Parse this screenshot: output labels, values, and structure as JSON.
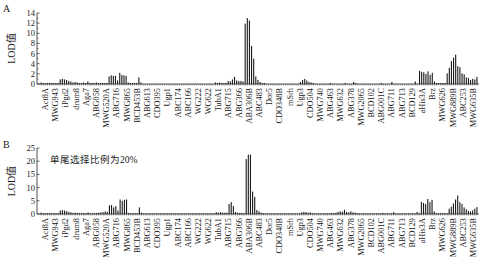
{
  "chart_data": [
    {
      "panel_label": "A",
      "type": "bar",
      "title": "",
      "annotation": "",
      "xlabel": "",
      "ylabel": "LOD值",
      "ylim": [
        0,
        14
      ],
      "yticks": [
        0,
        2,
        4,
        6,
        8,
        10,
        12,
        14
      ],
      "grid": false,
      "x_tick_labels": [
        "Act8A",
        "MWG943",
        "iPgd2",
        "drum8",
        "Aga7",
        "ABG058",
        "MWG520A",
        "ABG716",
        "MWG865",
        "BCD453B",
        "ABG613",
        "CDO395",
        "Ugp1",
        "ABC174",
        "ABC166",
        "WG222",
        "WG622",
        "TubA1",
        "ABG715",
        "ABG366",
        "ABA306B",
        "ABC483",
        "Dor5",
        "CDO348B",
        "mSrh",
        "Ugp3",
        "CDO504",
        "MWG740",
        "ABG463",
        "MWG632",
        "ABG378",
        "MWG2065",
        "BCD102",
        "ABG001C",
        "ABG711",
        "ABG713",
        "BCD129",
        "aHis3A",
        "Brz",
        "MWG626",
        "MWG889B",
        "ABC253",
        "MWG635B"
      ],
      "values": [
        0.3,
        0.2,
        0.2,
        0.2,
        0.2,
        0.2,
        0.2,
        0.2,
        0.2,
        0.9,
        1.0,
        0.9,
        0.8,
        0.6,
        0.5,
        0.3,
        0.4,
        0.3,
        0.2,
        0.2,
        0.3,
        0.2,
        0.5,
        0.2,
        0.2,
        0.2,
        0.3,
        0.2,
        0.2,
        0.2,
        0.2,
        0.2,
        1.5,
        1.7,
        1.6,
        1.6,
        0.7,
        2.2,
        1.8,
        1.7,
        1.6,
        0.3,
        0.2,
        0.2,
        0.2,
        0.2,
        1.3,
        0.3,
        0.1,
        0.1,
        0.1,
        0.1,
        0.1,
        0.1,
        0.1,
        0.1,
        0.1,
        0.1,
        0.1,
        0.1,
        0.1,
        0.1,
        0.1,
        0.1,
        0.1,
        0.1,
        0.1,
        0.1,
        0.1,
        0.1,
        0.1,
        0.1,
        0.1,
        0.1,
        0.1,
        0.1,
        0.1,
        0.1,
        0.1,
        0.1,
        0.1,
        0.1,
        0.3,
        0.2,
        0.3,
        0.2,
        0.2,
        0.2,
        0.6,
        0.5,
        0.9,
        1.4,
        0.7,
        0.6,
        0.6,
        0.5,
        11.9,
        13.0,
        12.5,
        7.5,
        5.0,
        1.5,
        0.8,
        0.4,
        0.2,
        0.2,
        0.1,
        0.1,
        0.1,
        0.1,
        0.1,
        0.1,
        0.1,
        0.1,
        0.1,
        0.1,
        0.1,
        0.1,
        0.1,
        0.1,
        0.1,
        0.1,
        0.4,
        0.8,
        1.0,
        0.7,
        0.4,
        0.3,
        0.2,
        0.1,
        0.1,
        0.1,
        0.1,
        0.1,
        0.1,
        0.1,
        0.2,
        0.1,
        0.1,
        0.1,
        0.1,
        0.1,
        0.1,
        0.2,
        0.1,
        0.1,
        0.1,
        0.4,
        0.2,
        0.1,
        0.1,
        0.1,
        0.1,
        0.1,
        0.1,
        0.1,
        0.1,
        0.1,
        0.1,
        0.1,
        0.2,
        0.1,
        0.1,
        0.1,
        0.1,
        0.4,
        0.1,
        0.1,
        0.1,
        0.1,
        0.1,
        0.1,
        0.1,
        0.1,
        0.1,
        0.1,
        0.5,
        0.1,
        2.6,
        2.4,
        2.3,
        2.0,
        2.5,
        1.8,
        2.2,
        0.5,
        0.2,
        0.2,
        0.2,
        0.2,
        0.2,
        2.1,
        3.2,
        4.5,
        5.2,
        5.8,
        3.5,
        3.3,
        2.1,
        1.9,
        1.3,
        1.2,
        0.8,
        1.0,
        0.9,
        1.4
      ]
    },
    {
      "panel_label": "B",
      "type": "bar",
      "title": "",
      "annotation": "单尾选择比例为20%",
      "xlabel": "",
      "ylabel": "LOD值",
      "ylim": [
        0,
        25
      ],
      "yticks": [
        0,
        5,
        10,
        15,
        20,
        25
      ],
      "grid": false,
      "x_tick_labels": [
        "Act8A",
        "MWG943",
        "iPgd2",
        "drum8",
        "Aga7",
        "ABG058",
        "MWG520A",
        "ABG716",
        "MWG865",
        "BCD453B",
        "ABG613",
        "CDO395",
        "Ugp1",
        "ABC174",
        "ABC166",
        "WG222",
        "WG622",
        "TubA1",
        "ABG715",
        "ABG366",
        "ABA306B",
        "ABC483",
        "Dor5",
        "CDO348B",
        "mSrh",
        "Ugp3",
        "CDO504",
        "MWG740",
        "ABG463",
        "MWG632",
        "ABG378",
        "MWG2065",
        "BCD102",
        "ABG001C",
        "ABG711",
        "ABG713",
        "BCD129",
        "aHis3A",
        "Brz",
        "MWG626",
        "MWG889B",
        "ABC253",
        "MWG635B"
      ],
      "values": [
        0.5,
        0.3,
        0.3,
        0.3,
        0.3,
        0.3,
        0.3,
        0.3,
        0.3,
        1.3,
        1.5,
        1.3,
        1.1,
        0.8,
        0.6,
        0.4,
        0.5,
        0.4,
        0.3,
        0.3,
        0.4,
        0.3,
        0.6,
        0.3,
        0.3,
        0.3,
        0.4,
        0.5,
        0.6,
        0.7,
        1.0,
        0.8,
        3.3,
        3.4,
        2.5,
        3.0,
        1.3,
        5.5,
        5.0,
        5.4,
        5.5,
        0.4,
        0.3,
        0.3,
        0.3,
        0.3,
        2.5,
        0.5,
        0.2,
        0.2,
        0.2,
        0.2,
        0.2,
        0.2,
        0.2,
        0.2,
        0.2,
        0.2,
        0.2,
        0.2,
        0.2,
        0.2,
        0.2,
        0.2,
        0.2,
        0.2,
        0.2,
        0.2,
        0.2,
        0.2,
        0.2,
        0.2,
        0.2,
        0.2,
        0.2,
        0.2,
        0.2,
        0.2,
        0.2,
        0.2,
        0.2,
        0.2,
        0.7,
        0.5,
        0.7,
        0.5,
        0.5,
        0.5,
        3.8,
        4.5,
        3.0,
        0.8,
        0.5,
        0.4,
        0.4,
        0.3,
        20.8,
        22.5,
        22.5,
        8.5,
        6.5,
        1.5,
        1.0,
        0.5,
        0.3,
        0.2,
        0.2,
        0.2,
        0.2,
        0.2,
        0.2,
        0.2,
        0.2,
        0.2,
        0.2,
        0.2,
        0.2,
        0.2,
        0.2,
        0.2,
        0.2,
        0.2,
        0.6,
        0.8,
        0.7,
        0.5,
        0.6,
        0.3,
        0.2,
        0.2,
        0.2,
        0.2,
        0.2,
        0.2,
        0.2,
        0.2,
        0.4,
        0.3,
        0.5,
        0.8,
        1.0,
        0.9,
        1.6,
        0.8,
        0.6,
        1.0,
        0.6,
        0.5,
        0.3,
        0.2,
        0.2,
        0.2,
        0.2,
        0.2,
        0.2,
        0.2,
        0.2,
        0.2,
        0.2,
        0.2,
        0.4,
        0.2,
        0.2,
        0.2,
        0.2,
        0.7,
        0.2,
        0.2,
        0.2,
        0.2,
        0.2,
        0.2,
        0.2,
        0.2,
        0.2,
        0.2,
        0.8,
        0.3,
        4.6,
        4.2,
        3.8,
        5.7,
        4.5,
        5.3,
        1.0,
        0.3,
        0.3,
        0.3,
        0.3,
        0.3,
        0.3,
        2.0,
        2.8,
        4.0,
        5.5,
        7.0,
        4.5,
        3.8,
        2.5,
        1.8,
        1.2,
        1.0,
        1.4,
        2.0,
        2.6
      ]
    }
  ]
}
